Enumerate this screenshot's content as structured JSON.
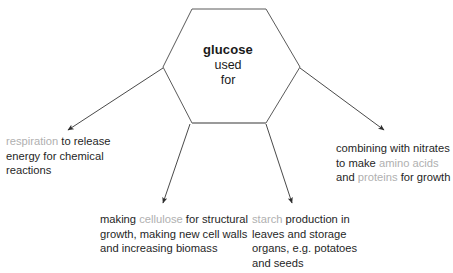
{
  "diagram": {
    "title": "glucose used for",
    "center": {
      "line1": "glucose",
      "line2": "used",
      "line3": "for"
    },
    "colors": {
      "stroke": "#5a5a5a",
      "stroke_bottom": "#8f8f8f",
      "arrow": "#4a4a4a",
      "text": "#1f1f1f",
      "term_highlight": "#b0b0b0",
      "background": "#ffffff"
    },
    "branches": [
      {
        "id": "respiration",
        "position": "upper-left",
        "segments": [
          {
            "text": "respiration",
            "style": "highlight"
          },
          {
            "text": " to release energy for chemical reactions",
            "style": "plain"
          }
        ],
        "plain_text": "respiration to release energy for chemical reactions"
      },
      {
        "id": "cellulose",
        "position": "lower-left",
        "segments": [
          {
            "text": "making ",
            "style": "plain"
          },
          {
            "text": "cellulose",
            "style": "highlight"
          },
          {
            "text": " for structural growth, making new cell walls and increasing biomass",
            "style": "plain"
          }
        ],
        "plain_text": "making cellulose for structural growth, making new cell walls and increasing biomass"
      },
      {
        "id": "starch",
        "position": "lower-right",
        "segments": [
          {
            "text": "starch",
            "style": "highlight"
          },
          {
            "text": " production in leaves and storage organs, e.g. potatoes and seeds",
            "style": "plain"
          }
        ],
        "plain_text": "starch production in leaves and storage organs, e.g. potatoes and seeds"
      },
      {
        "id": "protein",
        "position": "upper-right",
        "segments": [
          {
            "text": "combining with nitrates to make ",
            "style": "plain"
          },
          {
            "text": "amino acids",
            "style": "highlight"
          },
          {
            "text": " and ",
            "style": "plain"
          },
          {
            "text": "proteins",
            "style": "highlight"
          },
          {
            "text": " for growth",
            "style": "plain"
          }
        ],
        "plain_text": "combining with nitrates to make amino acids and proteins for growth"
      }
    ]
  }
}
